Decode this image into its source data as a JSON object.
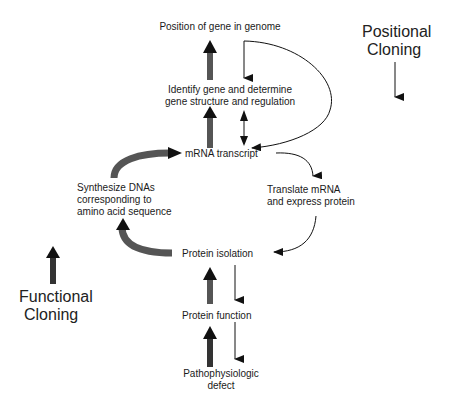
{
  "diagram": {
    "type": "flowchart",
    "nodes": {
      "position_of_gene": "Position of gene in genome",
      "identify_gene_line1": "Identify gene and determine",
      "identify_gene_line2": "gene structure and regulation",
      "mrna_transcript": "mRNA transcript",
      "synthesize_line1": "Synthesize DNAs",
      "synthesize_line2": "corresponding to",
      "synthesize_line3": "amino acid sequence",
      "translate_line1": "Translate mRNA",
      "translate_line2": "and express protein",
      "protein_isolation": "Protein isolation",
      "protein_function": "Protein function",
      "patho_line1": "Pathophysiologic",
      "patho_line2": "defect"
    },
    "legend": {
      "positional_line1": "Positional",
      "positional_line2": "Cloning",
      "functional_line1": "Functional",
      "functional_line2": "Cloning"
    },
    "colors": {
      "thick_arrow": "#555555",
      "thick_arrow_head": "#111111",
      "thin_arrow": "#111111",
      "text": "#1a1a1a"
    }
  }
}
